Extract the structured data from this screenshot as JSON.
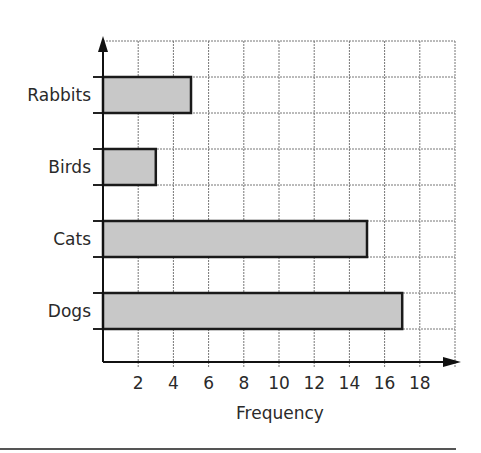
{
  "chart_data": {
    "type": "bar",
    "orientation": "horizontal",
    "title": "",
    "categories": [
      "Rabbits",
      "Birds",
      "Cats",
      "Dogs"
    ],
    "values": [
      5,
      3,
      15,
      17
    ],
    "xlabel": "Frequency",
    "ylabel": "",
    "xticks": [
      2,
      4,
      6,
      8,
      10,
      12,
      14,
      16,
      18
    ],
    "xlim": [
      0,
      20
    ],
    "grid": true,
    "legend": null,
    "bar_color": "#c8c8c8",
    "bar_edge_color": "#1a1a1a"
  }
}
